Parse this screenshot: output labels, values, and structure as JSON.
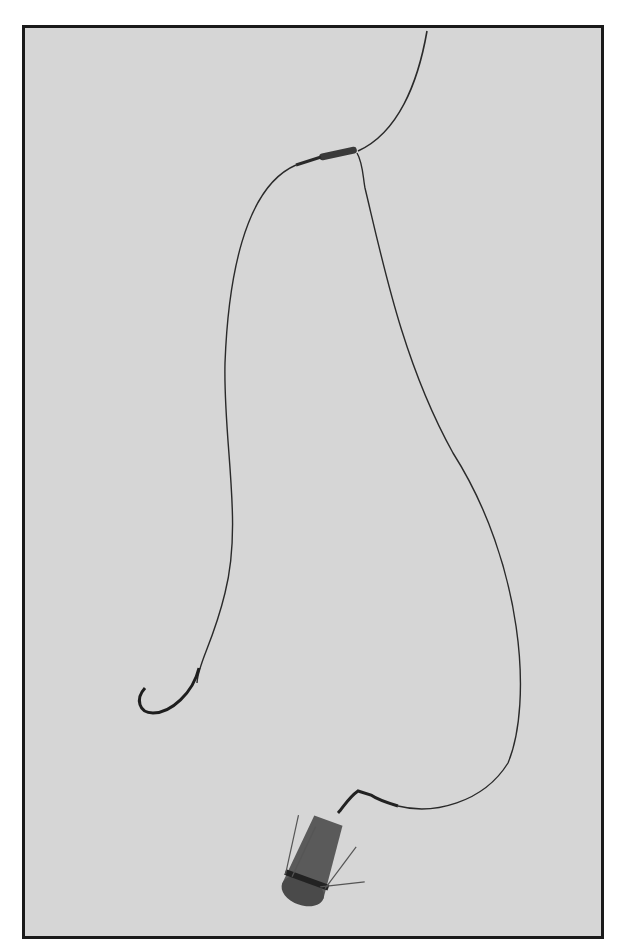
{
  "image": {
    "description": "Black-and-white photograph of a fishing rig: main line joined at a barrel swivel, one leader ending in a hook, another leader ending in a grapnel/spike sinker weight",
    "elements": [
      "main-line",
      "barrel-swivel",
      "hook-leader",
      "fishing-hook",
      "weight-leader",
      "snap-swivel",
      "spiked-sinker"
    ],
    "colors": {
      "background": "#d6d6d6",
      "border": "#1a1a1a",
      "line": "#2a2a2a",
      "sinker": "#5a5a5a"
    }
  }
}
